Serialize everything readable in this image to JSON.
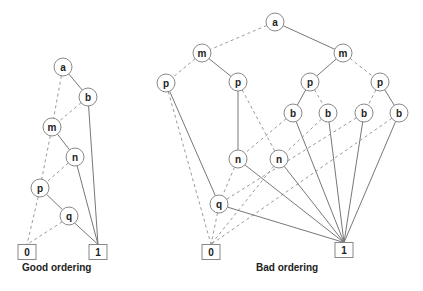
{
  "diagrams": [
    {
      "caption": "Good ordering",
      "caption_pos": [
        22,
        262
      ],
      "nodes": [
        {
          "id": "a",
          "label": "a",
          "x": 63,
          "y": 67
        },
        {
          "id": "b",
          "label": "b",
          "x": 88,
          "y": 97
        },
        {
          "id": "m",
          "label": "m",
          "x": 52,
          "y": 127
        },
        {
          "id": "n",
          "label": "n",
          "x": 75,
          "y": 157
        },
        {
          "id": "p",
          "label": "p",
          "x": 40,
          "y": 188
        },
        {
          "id": "q",
          "label": "q",
          "x": 69,
          "y": 216
        }
      ],
      "terminals": [
        {
          "id": "t0",
          "label": "0",
          "x": 27,
          "y": 252
        },
        {
          "id": "t1",
          "label": "1",
          "x": 98,
          "y": 252
        }
      ],
      "edges": [
        {
          "from": "a",
          "to": "b",
          "type": "solid"
        },
        {
          "from": "a",
          "to": "m",
          "type": "dashed"
        },
        {
          "from": "b",
          "to": "t1",
          "type": "solid"
        },
        {
          "from": "b",
          "to": "m",
          "type": "dashed"
        },
        {
          "from": "m",
          "to": "n",
          "type": "solid"
        },
        {
          "from": "m",
          "to": "p",
          "type": "dashed"
        },
        {
          "from": "n",
          "to": "t1",
          "type": "solid"
        },
        {
          "from": "n",
          "to": "p",
          "type": "dashed"
        },
        {
          "from": "p",
          "to": "q",
          "type": "solid"
        },
        {
          "from": "p",
          "to": "t0",
          "type": "dashed"
        },
        {
          "from": "q",
          "to": "t1",
          "type": "solid"
        },
        {
          "from": "q",
          "to": "t0",
          "type": "dashed"
        }
      ]
    },
    {
      "caption": "Bad ordering",
      "caption_pos": [
        256,
        262
      ],
      "nodes": [
        {
          "id": "a",
          "label": "a",
          "x": 275,
          "y": 22
        },
        {
          "id": "m1",
          "label": "m",
          "x": 202,
          "y": 53
        },
        {
          "id": "m2",
          "label": "m",
          "x": 343,
          "y": 53
        },
        {
          "id": "p1",
          "label": "p",
          "x": 166,
          "y": 83
        },
        {
          "id": "p2",
          "label": "p",
          "x": 238,
          "y": 82
        },
        {
          "id": "p3",
          "label": "p",
          "x": 310,
          "y": 82
        },
        {
          "id": "p4",
          "label": "p",
          "x": 380,
          "y": 82
        },
        {
          "id": "b1",
          "label": "b",
          "x": 293,
          "y": 113
        },
        {
          "id": "b2",
          "label": "b",
          "x": 328,
          "y": 113
        },
        {
          "id": "b3",
          "label": "b",
          "x": 364,
          "y": 113
        },
        {
          "id": "b4",
          "label": "b",
          "x": 399,
          "y": 113
        },
        {
          "id": "n1",
          "label": "n",
          "x": 238,
          "y": 159
        },
        {
          "id": "n2",
          "label": "n",
          "x": 279,
          "y": 159
        },
        {
          "id": "q",
          "label": "q",
          "x": 219,
          "y": 204
        }
      ],
      "terminals": [
        {
          "id": "t0",
          "label": "0",
          "x": 211,
          "y": 252
        },
        {
          "id": "t1",
          "label": "1",
          "x": 344,
          "y": 250
        }
      ],
      "edges": [
        {
          "from": "a",
          "to": "m2",
          "type": "solid"
        },
        {
          "from": "a",
          "to": "m1",
          "type": "dashed"
        },
        {
          "from": "m1",
          "to": "p2",
          "type": "solid"
        },
        {
          "from": "m1",
          "to": "p1",
          "type": "dashed"
        },
        {
          "from": "m2",
          "to": "p3",
          "type": "solid"
        },
        {
          "from": "m2",
          "to": "p4",
          "type": "dashed"
        },
        {
          "from": "p1",
          "to": "q",
          "type": "solid"
        },
        {
          "from": "p1",
          "to": "t0",
          "type": "dashed"
        },
        {
          "from": "p2",
          "to": "n1",
          "type": "solid"
        },
        {
          "from": "p2",
          "to": "n2",
          "type": "dashed"
        },
        {
          "from": "p3",
          "to": "b1",
          "type": "solid"
        },
        {
          "from": "p3",
          "to": "b2",
          "type": "dashed"
        },
        {
          "from": "p4",
          "to": "b4",
          "type": "solid"
        },
        {
          "from": "p4",
          "to": "b3",
          "type": "dashed"
        },
        {
          "from": "b1",
          "to": "t1",
          "type": "solid"
        },
        {
          "from": "b1",
          "to": "n1",
          "type": "dashed"
        },
        {
          "from": "b2",
          "to": "t1",
          "type": "solid"
        },
        {
          "from": "b2",
          "to": "n2",
          "type": "dashed"
        },
        {
          "from": "b3",
          "to": "t1",
          "type": "solid"
        },
        {
          "from": "b3",
          "to": "q",
          "type": "dashed"
        },
        {
          "from": "b4",
          "to": "t1",
          "type": "solid"
        },
        {
          "from": "b4",
          "to": "t0",
          "type": "dashed"
        },
        {
          "from": "n1",
          "to": "t1",
          "type": "solid"
        },
        {
          "from": "n1",
          "to": "q",
          "type": "dashed"
        },
        {
          "from": "n2",
          "to": "t1",
          "type": "solid"
        },
        {
          "from": "n2",
          "to": "t0",
          "type": "dashed"
        },
        {
          "from": "q",
          "to": "t1",
          "type": "solid"
        },
        {
          "from": "q",
          "to": "t0",
          "type": "dashed"
        }
      ]
    }
  ],
  "style": {
    "node_radius": 9,
    "terminal_w": 18,
    "terminal_h": 15
  }
}
